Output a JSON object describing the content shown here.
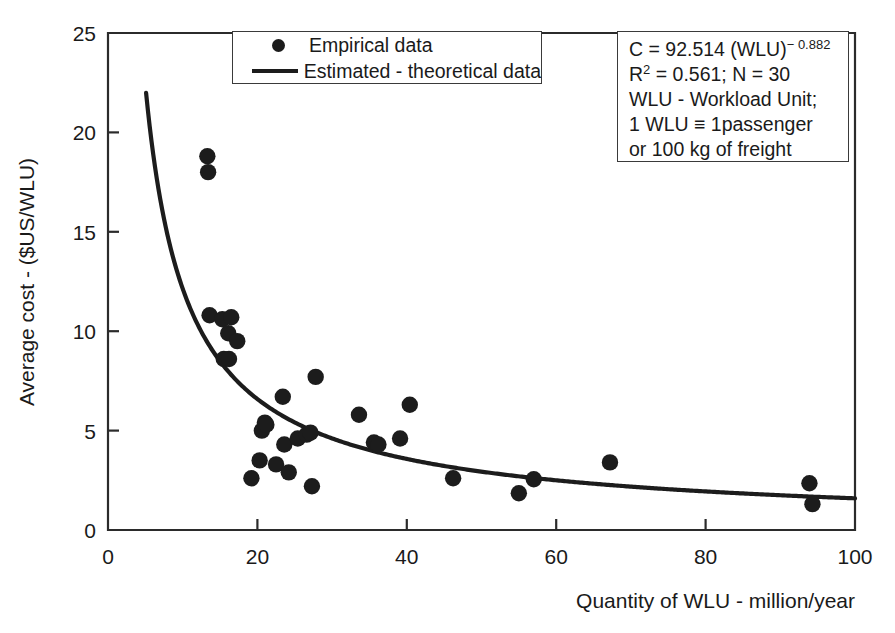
{
  "chart_data": {
    "type": "scatter",
    "title": "",
    "xlabel": "Quantity of WLU - million/year",
    "ylabel": "Average cost - ($US/WLU)",
    "xlim": [
      0,
      100
    ],
    "ylim": [
      0,
      25
    ],
    "xticks": [
      "0",
      "20",
      "40",
      "60",
      "80",
      "100"
    ],
    "xtick_values": [
      0,
      20,
      40,
      60,
      80,
      100
    ],
    "yticks": [
      "0",
      "5",
      "10",
      "15",
      "20",
      "25"
    ],
    "ytick_values": [
      0,
      5,
      10,
      15,
      20,
      25
    ],
    "grid": false,
    "legend_position": "top-center",
    "series": [
      {
        "name": "Empirical data",
        "marker": "filled-circle",
        "color": "#1c1c1c",
        "points": [
          [
            13.3,
            18.8
          ],
          [
            13.4,
            18.0
          ],
          [
            13.6,
            10.8
          ],
          [
            15.3,
            10.6
          ],
          [
            16.5,
            10.7
          ],
          [
            16.1,
            9.9
          ],
          [
            15.5,
            8.6
          ],
          [
            16.2,
            8.6
          ],
          [
            17.3,
            9.5
          ],
          [
            19.2,
            2.6
          ],
          [
            20.3,
            3.5
          ],
          [
            20.6,
            5.0
          ],
          [
            21.0,
            5.4
          ],
          [
            21.2,
            5.3
          ],
          [
            22.5,
            3.3
          ],
          [
            23.4,
            6.7
          ],
          [
            23.6,
            4.3
          ],
          [
            24.2,
            2.9
          ],
          [
            25.4,
            4.6
          ],
          [
            26.6,
            4.8
          ],
          [
            27.1,
            4.9
          ],
          [
            27.3,
            2.2
          ],
          [
            27.8,
            7.7
          ],
          [
            33.6,
            5.8
          ],
          [
            35.6,
            4.4
          ],
          [
            36.2,
            4.3
          ],
          [
            39.1,
            4.6
          ],
          [
            40.4,
            6.3
          ],
          [
            46.2,
            2.6
          ],
          [
            55.0,
            1.85
          ],
          [
            57.0,
            2.55
          ],
          [
            67.2,
            3.4
          ],
          [
            93.9,
            2.35
          ],
          [
            94.3,
            1.3
          ]
        ]
      },
      {
        "name": "Estimated - theoretical data",
        "marker": "line",
        "color": "#1c1c1c",
        "equation": "C = 92.514 (WLU)^-0.882",
        "coefficient": 92.514,
        "exponent": -0.882,
        "x_start": 5.1,
        "x_end": 100
      }
    ]
  },
  "legend": {
    "items": [
      {
        "key": "marker-dot",
        "label": "Empirical data"
      },
      {
        "key": "marker-line",
        "label": "Estimated - theoretical data"
      }
    ]
  },
  "annotation": {
    "line1_pre": "C = 92.514 (WLU)",
    "line1_sup": "− 0.882",
    "line2_pre": "R",
    "line2_sup": "2",
    "line2_post": " = 0.561; N = 30",
    "line3": "WLU - Workload Unit;",
    "line4": "1 WLU ≡ 1passenger",
    "line5": "or 100 kg of freight"
  },
  "axes": {
    "x_title": "Quantity of WLU - million/year",
    "y_title": "Average cost - ($US/WLU)",
    "x_tick_labels": [
      "0",
      "20",
      "40",
      "60",
      "80",
      "100"
    ],
    "y_tick_labels": [
      "0",
      "5",
      "10",
      "15",
      "20",
      "25"
    ]
  },
  "style": {
    "axis_color": "#2b2b2b",
    "marker_color": "#1c1c1c",
    "curve_color": "#1c1c1c",
    "background": "#ffffff"
  }
}
